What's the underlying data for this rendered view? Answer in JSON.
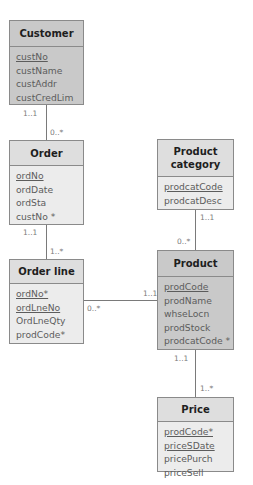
{
  "entities": {
    "customer": {
      "name": "Customer",
      "attributes": [
        {
          "label": "custNo",
          "pk": true
        },
        {
          "label": "custName",
          "pk": false
        },
        {
          "label": "custAddr",
          "pk": false
        },
        {
          "label": "custCredLim",
          "pk": false
        }
      ]
    },
    "order": {
      "name": "Order",
      "attributes": [
        {
          "label": "ordNo",
          "pk": true
        },
        {
          "label": "ordDate",
          "pk": false
        },
        {
          "label": "ordSta",
          "pk": false
        },
        {
          "label": "custNo *",
          "pk": false
        }
      ]
    },
    "order_line": {
      "name": "Order line",
      "attributes": [
        {
          "label": "ordNo*",
          "pk": true
        },
        {
          "label": "ordLneNo",
          "pk": true
        },
        {
          "label": "OrdLneQty",
          "pk": false
        },
        {
          "label": "prodCode*",
          "pk": false
        }
      ]
    },
    "product_category": {
      "name": "Product category",
      "name_line1": "Product",
      "name_line2": "category",
      "attributes": [
        {
          "label": "prodcatCode",
          "pk": true
        },
        {
          "label": "prodcatDesc",
          "pk": false
        }
      ]
    },
    "product": {
      "name": "Product",
      "attributes": [
        {
          "label": "prodCode",
          "pk": true
        },
        {
          "label": "prodName",
          "pk": false
        },
        {
          "label": "whseLocn",
          "pk": false
        },
        {
          "label": "prodStock",
          "pk": false
        },
        {
          "label": "prodcatCode *",
          "pk": false
        }
      ]
    },
    "price": {
      "name": "Price",
      "attributes": [
        {
          "label": "prodCode*",
          "pk": true
        },
        {
          "label": "priceSDate",
          "pk": true
        },
        {
          "label": "pricePurch",
          "pk": false
        },
        {
          "label": "priceSell",
          "pk": false
        }
      ]
    }
  },
  "relationships": [
    {
      "from": "Customer",
      "to": "Order",
      "from_mult": "1..1",
      "to_mult": "0..*"
    },
    {
      "from": "Order",
      "to": "Order line",
      "from_mult": "1..1",
      "to_mult": "1..*"
    },
    {
      "from": "Product category",
      "to": "Product",
      "from_mult": "1..1",
      "to_mult": "0..*"
    },
    {
      "from": "Product",
      "to": "Order line",
      "from_mult": "1..1",
      "to_mult": "0..*"
    },
    {
      "from": "Product",
      "to": "Price",
      "from_mult": "1..1",
      "to_mult": "1..*"
    }
  ],
  "colors": {
    "border": "#8a8a8a",
    "dark_fill": "#c9c9c9",
    "light_header": "#dedede",
    "light_body": "#ececec"
  }
}
